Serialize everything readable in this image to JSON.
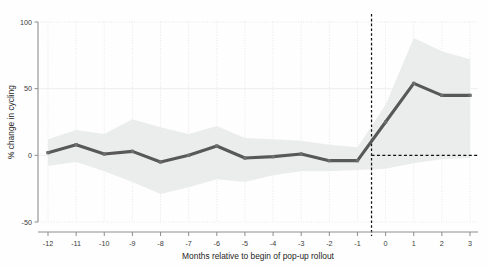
{
  "chart_data": {
    "type": "line",
    "title": "",
    "subtitle": "",
    "xlabel": "Months relative to begin of pop-up rollout",
    "ylabel": "% change in cycling",
    "x": [
      -12,
      -11,
      -10,
      -9,
      -8,
      -7,
      -6,
      -5,
      -4,
      -3,
      -2,
      -1,
      0,
      1,
      2,
      3
    ],
    "xtick_labels": [
      "-12",
      "-11",
      "-10",
      "-9",
      "-8",
      "-7",
      "-6",
      "-5",
      "-4",
      "-3",
      "-2",
      "-1",
      "0",
      "1",
      "2",
      "3"
    ],
    "ytick_labels": [
      "100",
      "50",
      "0",
      "-50"
    ],
    "yticks": [
      100,
      50,
      0,
      -50
    ],
    "xlim": [
      -12.6,
      3.6
    ],
    "ylim": [
      -50,
      100
    ],
    "grid": true,
    "legend": "none",
    "series": [
      {
        "name": "% change in cycling",
        "values": [
          2,
          8,
          1,
          3,
          -5,
          0,
          7,
          -2,
          -1,
          1,
          -4,
          -4,
          25,
          54,
          45,
          45
        ],
        "color": "#585858"
      }
    ],
    "confidence_band": {
      "name": "confidence interval",
      "color": "#e9ecea",
      "upper": [
        12,
        19,
        16,
        27,
        21,
        16,
        22,
        13,
        12,
        11,
        8,
        6,
        38,
        88,
        78,
        72
      ],
      "lower": [
        -8,
        -5,
        -12,
        -20,
        -29,
        -24,
        -18,
        -20,
        -15,
        -12,
        -12,
        -11,
        -10,
        -6,
        -3,
        -2
      ]
    },
    "annotations": [
      {
        "name": "rollout-vertical-reference",
        "type": "vline",
        "x": -0.5,
        "style": "dashed"
      },
      {
        "name": "zero-horizontal-reference",
        "type": "hline",
        "y": 0,
        "x_from": -0.5,
        "x_to": 3.6,
        "style": "dashed"
      }
    ]
  }
}
